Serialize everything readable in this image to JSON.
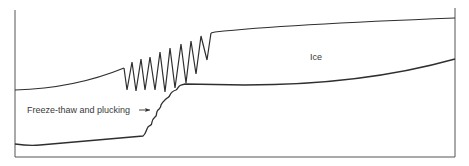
{
  "diagram": {
    "title": "",
    "labels": {
      "ice": "Ice",
      "process": "Freeze-thaw and plucking"
    },
    "colors": {
      "line": "#2f2f2f",
      "text": "#3a3a3a",
      "background": "#ffffff"
    },
    "elements": [
      {
        "name": "ice-surface",
        "description": "upper surface of glacier ice, rising left to right"
      },
      {
        "name": "crevasses",
        "description": "zig-zag crevasse zone over the bedrock step"
      },
      {
        "name": "glacier-bed",
        "description": "lower boundary of ice / bedrock surface with stepped riser"
      },
      {
        "name": "stepped-riser",
        "description": "bedrock step shaped by freeze-thaw and plucking"
      }
    ]
  }
}
